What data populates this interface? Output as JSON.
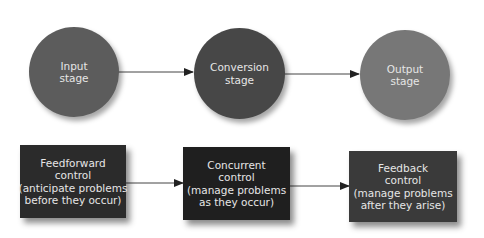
{
  "diagram": {
    "stages": [
      {
        "line1": "Input",
        "line2": "stage",
        "color": "#5c5c5c"
      },
      {
        "line1": "Conversion",
        "line2": "stage",
        "color": "#474747"
      },
      {
        "line1": "Output",
        "line2": "stage",
        "color": "#777777"
      }
    ],
    "controls": [
      {
        "line1": "Feedforward",
        "line2": "control",
        "line3": "(anticipate problems",
        "line4": "before they occur)",
        "color": "#2b2b2b"
      },
      {
        "line1": "Concurrent",
        "line2": "control",
        "line3": "(manage problems",
        "line4": "as they occur)",
        "color": "#1f1f1f"
      },
      {
        "line1": "Feedback",
        "line2": "control",
        "line3": "(manage problems",
        "line4": "after they arise)",
        "color": "#3a3a3a"
      }
    ],
    "arrow_color": "#333333"
  }
}
